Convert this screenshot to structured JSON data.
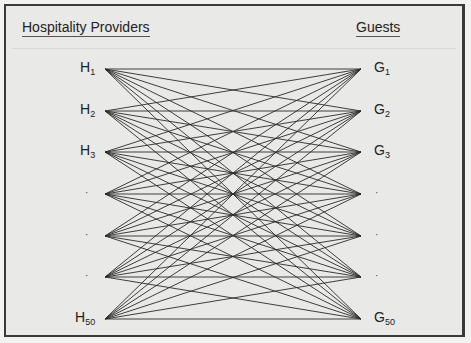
{
  "diagram": {
    "left_heading": "Hospitality Providers",
    "right_heading": "Guests",
    "left_nodes": [
      {
        "base": "H",
        "sub": "1"
      },
      {
        "base": "H",
        "sub": "2"
      },
      {
        "base": "H",
        "sub": "3"
      },
      {
        "base": "·",
        "sub": ""
      },
      {
        "base": "·",
        "sub": ""
      },
      {
        "base": "·",
        "sub": ""
      },
      {
        "base": "H",
        "sub": "50"
      }
    ],
    "right_nodes": [
      {
        "base": "G",
        "sub": "1"
      },
      {
        "base": "G",
        "sub": "2"
      },
      {
        "base": "G",
        "sub": "3"
      },
      {
        "base": "·",
        "sub": ""
      },
      {
        "base": "·",
        "sub": ""
      },
      {
        "base": "·",
        "sub": ""
      },
      {
        "base": "G",
        "sub": "50"
      }
    ],
    "edges": "complete bipartite: every provider connected to every guest",
    "colors": {
      "line": "#2a2a2a",
      "background": "#e9e9e7",
      "border": "#3a3a3a"
    }
  }
}
